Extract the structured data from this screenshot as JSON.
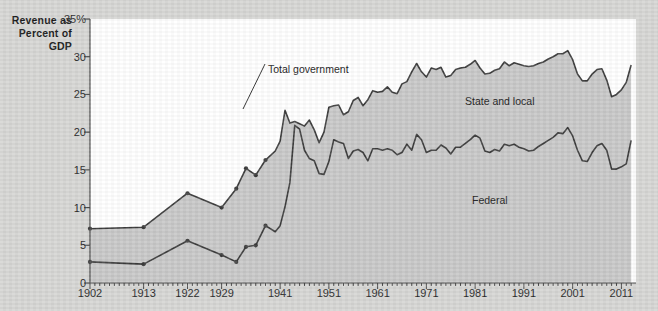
{
  "axis_title": {
    "line1": "Revenue as",
    "line2": "Percent of",
    "line3": "GDP"
  },
  "labels": {
    "total_government": "Total government",
    "state_and_local": "State and local",
    "federal": "Federal"
  },
  "colors": {
    "page_background": "#d6d6d4",
    "plot_background": "#ffffff",
    "area_fill": "#c8c8c8",
    "line": "#3b3b3b",
    "axis": "#4a4a4a",
    "text": "#1a1a1a"
  },
  "chart_data": {
    "type": "area",
    "title": "",
    "subtitle": "",
    "xlabel": "",
    "ylabel": "Revenue as Percent of GDP",
    "xlim": [
      1902,
      2014
    ],
    "ylim": [
      0,
      35
    ],
    "grid": false,
    "legend": "inline-annotations",
    "ytick_labels": [
      "0",
      "5",
      "10",
      "15",
      "20",
      "25",
      "30",
      "35%"
    ],
    "ytick_values": [
      0,
      5,
      10,
      15,
      20,
      25,
      30,
      35
    ],
    "xtick_labels": [
      "1902",
      "1913",
      "1922",
      "1929",
      "1941",
      "1951",
      "1961",
      "1971",
      "1981",
      "1991",
      "2001",
      "2011"
    ],
    "xtick_values": [
      1902,
      1913,
      1922,
      1929,
      1941,
      1951,
      1961,
      1971,
      1981,
      1991,
      2001,
      2011
    ],
    "annotations": [
      {
        "text": "Total government",
        "x": 1941,
        "y": 23.0,
        "note": "leader line points to the 1941 peak of the upper curve"
      },
      {
        "text": "State and local",
        "x": 1987,
        "y": 26.5,
        "note": "band between the two curves"
      },
      {
        "text": "Federal",
        "x": 1988,
        "y": 12.5,
        "note": "band below the lower curve"
      }
    ],
    "series": [
      {
        "name": "Total government",
        "stacking": "cumulative-top",
        "x": [
          1902,
          1913,
          1922,
          1929,
          1932,
          1934,
          1936,
          1938,
          1940,
          1941,
          1942,
          1943,
          1944,
          1945,
          1946,
          1947,
          1948,
          1949,
          1950,
          1951,
          1952,
          1953,
          1954,
          1955,
          1956,
          1957,
          1958,
          1959,
          1960,
          1961,
          1962,
          1963,
          1964,
          1965,
          1966,
          1967,
          1968,
          1969,
          1970,
          1971,
          1972,
          1973,
          1974,
          1975,
          1976,
          1977,
          1978,
          1979,
          1980,
          1981,
          1982,
          1983,
          1984,
          1985,
          1986,
          1987,
          1988,
          1989,
          1990,
          1991,
          1992,
          1993,
          1994,
          1995,
          1996,
          1997,
          1998,
          1999,
          2000,
          2001,
          2002,
          2003,
          2004,
          2005,
          2006,
          2007,
          2008,
          2009,
          2010,
          2011,
          2012,
          2013
        ],
        "y": [
          7.2,
          7.4,
          11.9,
          10.0,
          12.5,
          15.2,
          14.3,
          16.3,
          17.5,
          18.8,
          22.9,
          21.2,
          21.4,
          21.1,
          20.8,
          21.6,
          20.3,
          18.6,
          20.0,
          23.3,
          23.5,
          23.6,
          22.3,
          22.7,
          24.2,
          24.6,
          23.5,
          24.3,
          25.5,
          25.3,
          25.4,
          26.0,
          25.3,
          25.1,
          26.4,
          26.7,
          28.0,
          29.1,
          28.0,
          27.3,
          28.5,
          28.3,
          28.6,
          27.3,
          27.5,
          28.3,
          28.5,
          28.6,
          29.0,
          29.5,
          28.5,
          27.7,
          27.8,
          28.2,
          28.4,
          29.3,
          28.8,
          29.2,
          29.0,
          28.8,
          28.7,
          28.8,
          29.1,
          29.3,
          29.7,
          30.0,
          30.4,
          30.4,
          30.8,
          29.6,
          27.7,
          26.8,
          26.8,
          27.7,
          28.3,
          28.4,
          26.9,
          24.7,
          25.0,
          25.6,
          26.6,
          28.9
        ]
      },
      {
        "name": "Federal",
        "stacking": "bottom-band",
        "x": [
          1902,
          1913,
          1922,
          1929,
          1932,
          1934,
          1936,
          1938,
          1940,
          1941,
          1942,
          1943,
          1944,
          1945,
          1946,
          1947,
          1948,
          1949,
          1950,
          1951,
          1952,
          1953,
          1954,
          1955,
          1956,
          1957,
          1958,
          1959,
          1960,
          1961,
          1962,
          1963,
          1964,
          1965,
          1966,
          1967,
          1968,
          1969,
          1970,
          1971,
          1972,
          1973,
          1974,
          1975,
          1976,
          1977,
          1978,
          1979,
          1980,
          1981,
          1982,
          1983,
          1984,
          1985,
          1986,
          1987,
          1988,
          1989,
          1990,
          1991,
          1992,
          1993,
          1994,
          1995,
          1996,
          1997,
          1998,
          1999,
          2000,
          2001,
          2002,
          2003,
          2004,
          2005,
          2006,
          2007,
          2008,
          2009,
          2010,
          2011,
          2012,
          2013
        ],
        "y": [
          2.8,
          2.5,
          5.6,
          3.7,
          2.8,
          4.8,
          5.0,
          7.6,
          6.8,
          7.6,
          10.1,
          13.3,
          20.9,
          20.4,
          17.6,
          16.5,
          16.2,
          14.5,
          14.4,
          16.1,
          19.0,
          18.7,
          18.5,
          16.5,
          17.5,
          17.7,
          17.3,
          16.2,
          17.8,
          17.8,
          17.6,
          17.8,
          17.6,
          17.0,
          17.3,
          18.4,
          17.6,
          19.7,
          19.0,
          17.3,
          17.6,
          17.6,
          18.3,
          17.9,
          17.1,
          18.0,
          18.0,
          18.5,
          19.0,
          19.6,
          19.2,
          17.5,
          17.3,
          17.7,
          17.5,
          18.4,
          18.2,
          18.4,
          18.0,
          17.8,
          17.5,
          17.6,
          18.1,
          18.5,
          18.9,
          19.3,
          19.9,
          19.8,
          20.6,
          19.5,
          17.6,
          16.2,
          16.1,
          17.3,
          18.2,
          18.5,
          17.6,
          15.1,
          15.1,
          15.4,
          15.8,
          18.9
        ]
      }
    ]
  }
}
